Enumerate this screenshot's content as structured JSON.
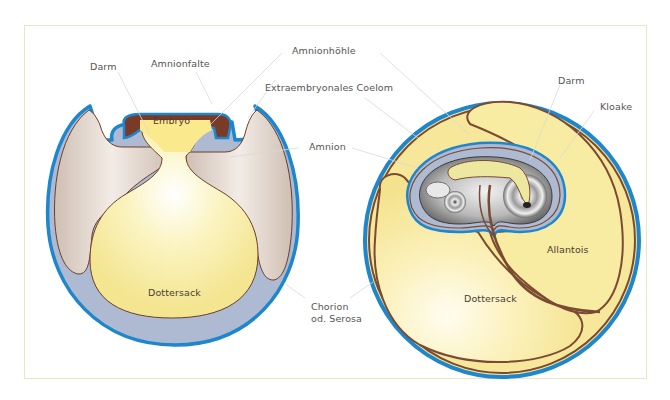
{
  "diagram": {
    "title": "",
    "colors": {
      "chorion_blue": "#1e86cc",
      "membrane_brown": "#7a4a33",
      "yolk_yellow": "#f8eeaa",
      "coelom_beige": "#ddd0c4",
      "amnion_lightblue": "#aebad2",
      "frame": "#ece5c4",
      "leader": "#dcdcdc"
    },
    "labels": {
      "darm_left": "Darm",
      "amnionfalte": "Amnionfalte",
      "embryo": "Embryo",
      "amnionhoehle": "Amnionhöhle",
      "extraembryonales_coelom": "Extraembryonales Coelom",
      "amnion": "Amnion",
      "dottersack_left": "Dottersack",
      "chorion_line1": "Chorion",
      "chorion_line2": "od. Serosa",
      "darm_right": "Darm",
      "kloake": "Kloake",
      "allantois": "Allantois",
      "dottersack_right": "Dottersack"
    },
    "panels": [
      {
        "name": "early-stage",
        "description": "Amnion folds forming above embryo over yolk sac"
      },
      {
        "name": "late-stage",
        "description": "Embryo enclosed in amnion with allantois and yolk sac"
      }
    ]
  }
}
